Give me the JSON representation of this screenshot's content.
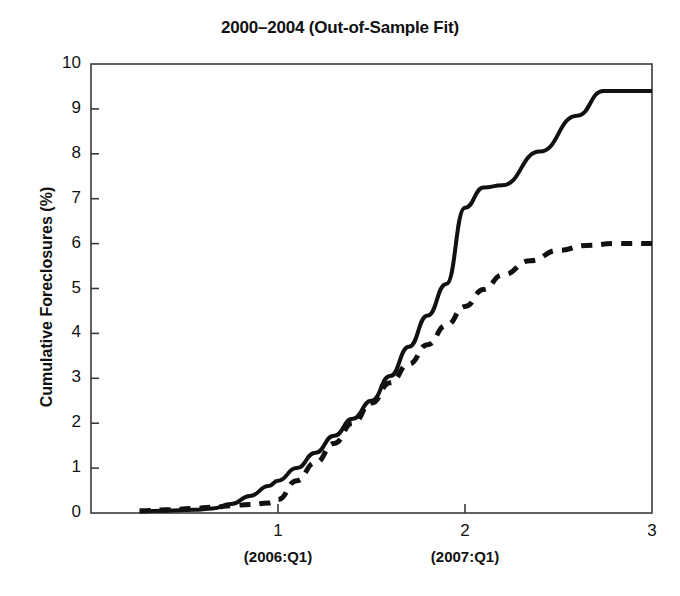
{
  "chart_data": {
    "type": "line",
    "title": "2000–2004 (Out-of-Sample Fit)",
    "xlabel": "",
    "ylabel": "Cumulative Foreclosures (%)",
    "xlim": [
      0,
      3
    ],
    "ylim": [
      0,
      10
    ],
    "grid": false,
    "legend": "none",
    "yticks": [
      0,
      1,
      2,
      3,
      4,
      5,
      6,
      7,
      8,
      9,
      10
    ],
    "ytick_labels": [
      "0",
      "1",
      "2",
      "3",
      "4",
      "5",
      "6",
      "7",
      "8",
      "9",
      "10"
    ],
    "xticks": [
      1,
      2,
      3
    ],
    "xtick_labels": [
      "1",
      "2",
      "3"
    ],
    "xtick_sublabels": [
      {
        "at": 1,
        "text": "(2006:Q1)"
      },
      {
        "at": 2,
        "text": "(2007:Q1)"
      }
    ],
    "series": [
      {
        "name": "actual",
        "style": "solid",
        "color": "#111111",
        "points": [
          [
            0.26,
            0.04
          ],
          [
            0.4,
            0.05
          ],
          [
            0.55,
            0.07
          ],
          [
            0.65,
            0.1
          ],
          [
            0.75,
            0.2
          ],
          [
            0.85,
            0.38
          ],
          [
            0.95,
            0.6
          ],
          [
            1.0,
            0.72
          ],
          [
            1.1,
            1.0
          ],
          [
            1.2,
            1.34
          ],
          [
            1.3,
            1.72
          ],
          [
            1.4,
            2.1
          ],
          [
            1.5,
            2.5
          ],
          [
            1.6,
            3.05
          ],
          [
            1.7,
            3.7
          ],
          [
            1.8,
            4.4
          ],
          [
            1.9,
            5.1
          ],
          [
            2.0,
            6.8
          ],
          [
            2.1,
            7.25
          ],
          [
            2.2,
            7.3
          ],
          [
            2.4,
            8.05
          ],
          [
            2.6,
            8.85
          ],
          [
            2.74,
            9.4
          ],
          [
            3.0,
            9.4
          ]
        ]
      },
      {
        "name": "predicted",
        "style": "dashed",
        "color": "#111111",
        "points": [
          [
            0.26,
            0.05
          ],
          [
            0.4,
            0.07
          ],
          [
            0.55,
            0.1
          ],
          [
            0.65,
            0.13
          ],
          [
            0.75,
            0.16
          ],
          [
            0.85,
            0.19
          ],
          [
            0.95,
            0.22
          ],
          [
            1.0,
            0.3
          ],
          [
            1.1,
            0.72
          ],
          [
            1.2,
            1.12
          ],
          [
            1.3,
            1.55
          ],
          [
            1.4,
            2.0
          ],
          [
            1.5,
            2.45
          ],
          [
            1.6,
            2.9
          ],
          [
            1.7,
            3.32
          ],
          [
            1.8,
            3.75
          ],
          [
            1.9,
            4.18
          ],
          [
            2.0,
            4.6
          ],
          [
            2.1,
            4.98
          ],
          [
            2.2,
            5.3
          ],
          [
            2.35,
            5.62
          ],
          [
            2.5,
            5.85
          ],
          [
            2.65,
            5.96
          ],
          [
            2.8,
            6.0
          ],
          [
            3.0,
            6.0
          ]
        ]
      }
    ]
  }
}
